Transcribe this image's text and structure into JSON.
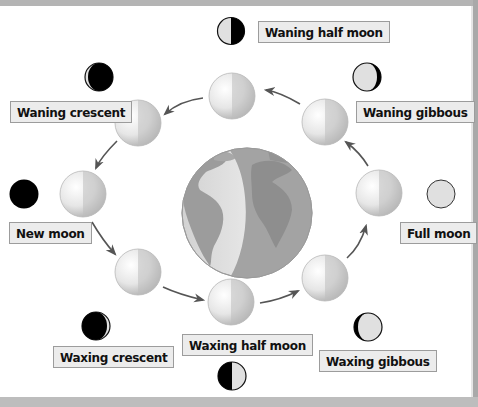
{
  "diagram": {
    "center": "Earth",
    "orbit_direction": "counterclockwise",
    "colors": {
      "background": "#ffffff",
      "frame": "#b4b4b4",
      "label_bg": "#ececec",
      "label_border": "#9c9c9c",
      "moon_dark": "#000000",
      "moon_lit": "#e0e0e0",
      "arrow": "#555555"
    },
    "phases": [
      {
        "id": "waning-half-moon",
        "label": "Waning half moon"
      },
      {
        "id": "waning-crescent",
        "label": "Waning crescent"
      },
      {
        "id": "new-moon",
        "label": "New moon"
      },
      {
        "id": "waxing-crescent",
        "label": "Waxing crescent"
      },
      {
        "id": "waxing-half-moon",
        "label": "Waxing half moon"
      },
      {
        "id": "waxing-gibbous",
        "label": "Waxing gibbous"
      },
      {
        "id": "full-moon",
        "label": "Full moon"
      },
      {
        "id": "waning-gibbous",
        "label": "Waning gibbous"
      }
    ]
  }
}
